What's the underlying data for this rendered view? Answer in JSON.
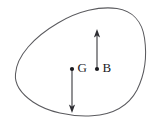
{
  "figure": {
    "type": "geometry-diagram",
    "background_color": "#ffffff",
    "curve_color": "#5a5a5e",
    "ink_color": "#1a1a1e",
    "region": {
      "name": "closed-curve",
      "shape_description": "egg / teardrop shaped closed convex curve",
      "extent_left_px": 15,
      "extent_right_px": 146,
      "extent_top_px": 8,
      "extent_bottom_px": 116
    },
    "points": [
      {
        "id": "G",
        "label": "G",
        "dot_x": 72,
        "dot_y": 69,
        "label_x": 78,
        "label_y": 69,
        "vector_direction": "down",
        "vector_from_y": 69,
        "vector_to_y": 112
      },
      {
        "id": "B",
        "label": "B",
        "dot_x": 97,
        "dot_y": 69,
        "label_x": 103,
        "label_y": 69,
        "vector_direction": "up",
        "vector_from_y": 69,
        "vector_to_y": 30
      }
    ]
  }
}
